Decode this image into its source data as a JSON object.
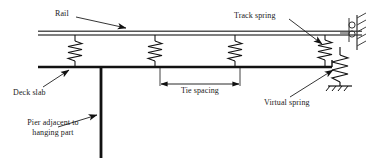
{
  "figure": {
    "type": "engineering-diagram",
    "background_color": "#ffffff",
    "line_color": "#1a1a1a"
  },
  "labels": {
    "rail": "Rail",
    "track_spring": "Track spring",
    "deck_slab": "Deck slab",
    "pier_line1": "Pier adjacent to",
    "pier_line2": "hanging part",
    "tie_spacing": "Tie spacing",
    "virtual_spring": "Virtual spring"
  },
  "components": {
    "rail": {
      "name": "rail-beam",
      "y": 33,
      "x_start": 38,
      "x_end": 362,
      "style": "double-line"
    },
    "deck_slab": {
      "name": "deck-slab-beam",
      "y": 67,
      "x_start": 38,
      "x_end": 332,
      "style": "thick-line"
    },
    "pier": {
      "name": "pier-column",
      "x": 101,
      "y_top": 67,
      "y_bottom": 158,
      "style": "thick-line"
    },
    "track_springs": {
      "count": 4,
      "x_positions": [
        75,
        155,
        235,
        325
      ],
      "y_top": 35,
      "y_bottom": 66
    },
    "virtual_spring": {
      "name": "virtual-spring",
      "x": 340,
      "y_top": 60,
      "y_bottom": 84
    },
    "wall_support": {
      "name": "fixed-wall-hatched",
      "x": 355,
      "y_top": 16,
      "y_bottom": 48
    },
    "ground_support": {
      "name": "ground-hatch",
      "x": 340,
      "y": 85
    }
  },
  "dimension": {
    "name": "tie-spacing-dimension",
    "y": 84,
    "x_start": 160,
    "x_end": 240,
    "arrows": "both-ends"
  }
}
